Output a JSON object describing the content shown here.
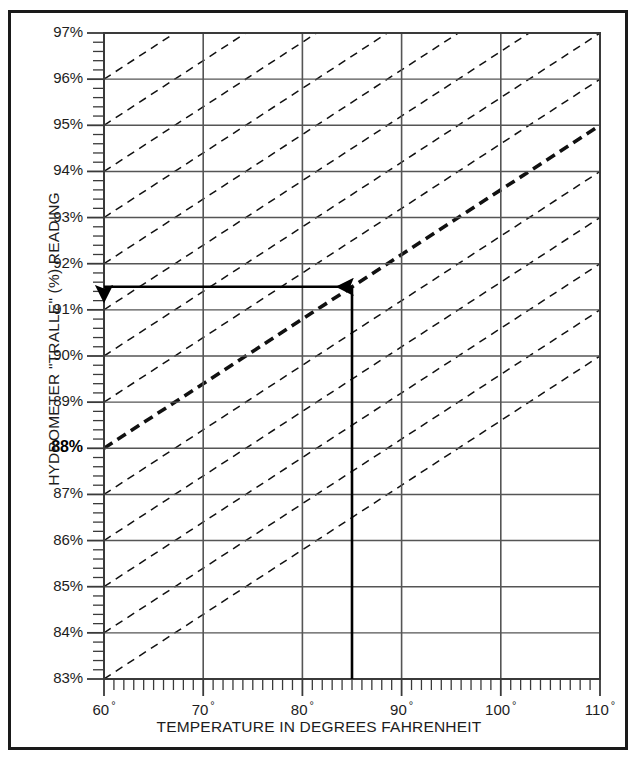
{
  "chart_data": {
    "type": "line",
    "title": "",
    "xlabel": "TEMPERATURE IN DEGREES FAHRENHEIT",
    "ylabel": "HYDROMETER \"TRALLE\" (%) READING",
    "xlim": [
      60,
      110
    ],
    "ylim": [
      83,
      97
    ],
    "x_major_ticks": [
      60,
      70,
      80,
      90,
      100,
      110
    ],
    "x_tick_labels": [
      "60",
      "70",
      "80",
      "90",
      "100",
      "110"
    ],
    "x_tick_suffix": "°",
    "x_minor_tick_step": 1,
    "y_major_ticks": [
      83,
      84,
      85,
      86,
      87,
      88,
      89,
      90,
      91,
      92,
      93,
      94,
      95,
      96,
      97
    ],
    "y_tick_labels": [
      "83%",
      "84%",
      "85%",
      "86%",
      "87%",
      "88%",
      "89%",
      "90%",
      "91%",
      "92%",
      "93%",
      "94%",
      "95%",
      "96%",
      "97%"
    ],
    "y_minor_tick_step": 0.2,
    "grid": true,
    "grid_color": "#555555",
    "legend": "none",
    "highlighted_y_label": "88%",
    "correction_slope_percent_per_degF": 0.14,
    "reference_temperature_degF": 60,
    "series": [
      {
        "name": "correction-line-83",
        "style": "dashed",
        "emphasis": "normal",
        "points": [
          [
            60,
            83
          ],
          [
            110,
            90
          ]
        ]
      },
      {
        "name": "correction-line-84",
        "style": "dashed",
        "emphasis": "normal",
        "points": [
          [
            60,
            84
          ],
          [
            110,
            91
          ]
        ]
      },
      {
        "name": "correction-line-85",
        "style": "dashed",
        "emphasis": "normal",
        "points": [
          [
            60,
            85
          ],
          [
            110,
            92
          ]
        ]
      },
      {
        "name": "correction-line-86",
        "style": "dashed",
        "emphasis": "normal",
        "points": [
          [
            60,
            86
          ],
          [
            110,
            93
          ]
        ]
      },
      {
        "name": "correction-line-87",
        "style": "dashed",
        "emphasis": "normal",
        "points": [
          [
            60,
            87
          ],
          [
            110,
            94
          ]
        ]
      },
      {
        "name": "correction-line-88",
        "style": "dashed",
        "emphasis": "bold",
        "points": [
          [
            60,
            88
          ],
          [
            110,
            95
          ]
        ]
      },
      {
        "name": "correction-line-89",
        "style": "dashed",
        "emphasis": "normal",
        "points": [
          [
            60,
            89
          ],
          [
            110,
            96
          ]
        ]
      },
      {
        "name": "correction-line-90",
        "style": "dashed",
        "emphasis": "normal",
        "points": [
          [
            60,
            90
          ],
          [
            110,
            97
          ]
        ]
      },
      {
        "name": "correction-line-91",
        "style": "dashed",
        "emphasis": "normal",
        "points": [
          [
            60,
            91
          ],
          [
            110,
            98
          ]
        ]
      },
      {
        "name": "correction-line-92",
        "style": "dashed",
        "emphasis": "normal",
        "points": [
          [
            60,
            92
          ],
          [
            110,
            99
          ]
        ]
      },
      {
        "name": "correction-line-93",
        "style": "dashed",
        "emphasis": "normal",
        "points": [
          [
            60,
            93
          ],
          [
            110,
            100
          ]
        ]
      },
      {
        "name": "correction-line-94",
        "style": "dashed",
        "emphasis": "normal",
        "points": [
          [
            60,
            94
          ],
          [
            110,
            101
          ]
        ]
      },
      {
        "name": "correction-line-95",
        "style": "dashed",
        "emphasis": "normal",
        "points": [
          [
            60,
            95
          ],
          [
            110,
            102
          ]
        ]
      },
      {
        "name": "correction-line-96",
        "style": "dashed",
        "emphasis": "normal",
        "points": [
          [
            60,
            96
          ],
          [
            110,
            103
          ]
        ]
      },
      {
        "name": "correction-line-97",
        "style": "dashed",
        "emphasis": "normal",
        "points": [
          [
            60,
            97
          ],
          [
            110,
            104
          ]
        ]
      }
    ],
    "annotations": [
      {
        "name": "vertical-read-arrow",
        "type": "arrow",
        "from": [
          85,
          83
        ],
        "to": [
          85,
          91.5
        ],
        "direction": "up"
      },
      {
        "name": "horizontal-read-arrow",
        "type": "arrow",
        "from": [
          85,
          91.5
        ],
        "to": [
          60,
          91.5
        ],
        "direction": "left"
      }
    ]
  }
}
